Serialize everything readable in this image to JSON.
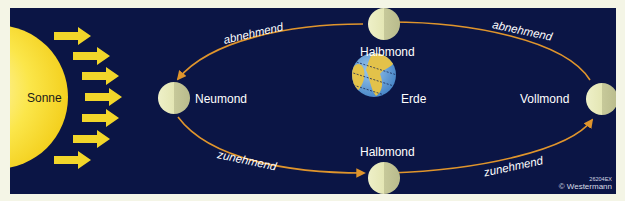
{
  "diagram": {
    "background_color": "#0b1545",
    "orbit_color": "#e0952c",
    "sun_arrow_color": "#f2d62a",
    "sun": {
      "label": "Sonne",
      "color": "#f8e23a"
    },
    "earth": {
      "label": "Erde"
    },
    "moons": [
      {
        "id": "neumond",
        "label": "Neumond",
        "position": "left"
      },
      {
        "id": "halbmond-top",
        "label": "Halbmond",
        "position": "top"
      },
      {
        "id": "halbmond-bottom",
        "label": "Halbmond",
        "position": "bottom"
      },
      {
        "id": "vollmond",
        "label": "Vollmond",
        "position": "right"
      }
    ],
    "orbit_labels": {
      "top_left": "abnehmend",
      "top_right": "abnehmend",
      "bottom_left": "zunehmend",
      "bottom_right": "zunehmend"
    },
    "sun_ray_arrows": 7,
    "credit": {
      "code": "26204EX",
      "copyright": "© Westermann"
    }
  }
}
